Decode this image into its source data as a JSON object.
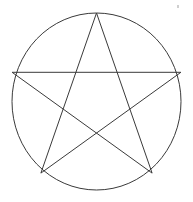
{
  "figure": {
    "title": "Pentagram inscribed in a circle",
    "background_color": "#ffffff",
    "stroke_color": "#3a3a3a",
    "stroke_width": 1,
    "canvas": {
      "width": 193,
      "height": 202
    },
    "circle": {
      "label": "circumscribed circle",
      "center_x": 96.5,
      "center_y": 101.5,
      "radius_x": 84.5,
      "radius_y": 88.5,
      "filled": false
    },
    "star": {
      "label": "pentagram",
      "points": 5,
      "filled": false,
      "self_intersecting": true,
      "orientation": "point-up",
      "vertices": [
        {
          "name": "apex",
          "x": 96.5,
          "y": 13.0
        },
        {
          "name": "upper-right",
          "x": 180.9,
          "y": 72.3
        },
        {
          "name": "lower-right",
          "x": 152.1,
          "y": 173.1
        },
        {
          "name": "lower-left",
          "x": 40.9,
          "y": 173.1
        },
        {
          "name": "upper-left",
          "x": 12.1,
          "y": 72.3
        }
      ],
      "draw_order": [
        0,
        2,
        4,
        1,
        3,
        0
      ],
      "chords": [
        {
          "name": "apex-to-lower-left",
          "from": "apex",
          "to": "lower-left"
        },
        {
          "name": "lower-left-to-upper-right",
          "from": "lower-left",
          "to": "upper-right"
        },
        {
          "name": "upper-right-to-upper-left",
          "from": "upper-right",
          "to": "upper-left"
        },
        {
          "name": "upper-left-to-lower-right",
          "from": "upper-left",
          "to": "lower-right"
        },
        {
          "name": "lower-right-to-apex",
          "from": "lower-right",
          "to": "apex"
        }
      ]
    },
    "artifact": {
      "name": "scan-speck",
      "x": 177,
      "y": 5,
      "color": "#cfcfcf"
    }
  }
}
